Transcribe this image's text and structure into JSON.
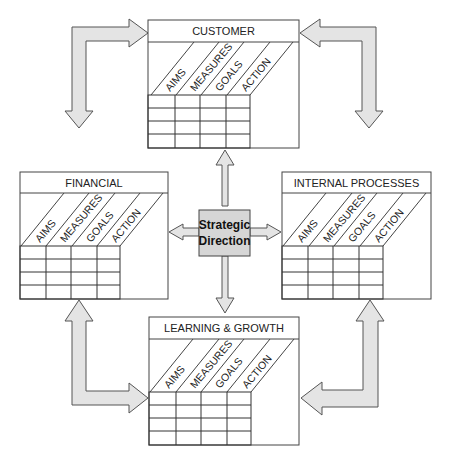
{
  "diagram": {
    "type": "balanced-scorecard",
    "center": {
      "line1": "Strategic",
      "line2": "Direction"
    },
    "columns": [
      "AIMS",
      "MEASURES",
      "GOALS",
      "ACTION"
    ],
    "boxes": {
      "customer": {
        "title": "CUSTOMER"
      },
      "financial": {
        "title": "FINANCIAL"
      },
      "internal": {
        "title": "INTERNAL PROCESSES"
      },
      "learning": {
        "title": "LEARNING & GROWTH"
      }
    },
    "colors": {
      "arrow_fill": "#e4e4e4",
      "arrow_stroke": "#555555",
      "center_fill": "#d6d6d6",
      "line": "#333333"
    }
  }
}
